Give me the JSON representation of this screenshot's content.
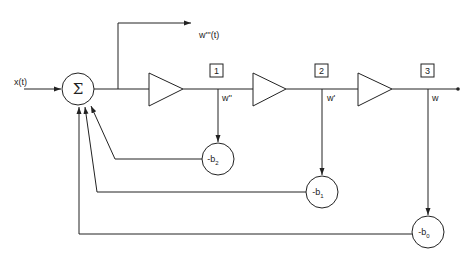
{
  "diagram": {
    "type": "signal-flow block diagram",
    "input_label": "x(t)",
    "summer_symbol": "Σ",
    "output_tap_label": "w'''(t)",
    "stages": [
      {
        "box_label": "1",
        "node_label": "w''"
      },
      {
        "box_label": "2",
        "node_label": "w'"
      },
      {
        "box_label": "3",
        "node_label": "w"
      }
    ],
    "feedback": [
      {
        "coef_prefix": "-b",
        "coef_sub": "2"
      },
      {
        "coef_prefix": "-b",
        "coef_sub": "1"
      },
      {
        "coef_prefix": "-b",
        "coef_sub": "0"
      }
    ]
  }
}
